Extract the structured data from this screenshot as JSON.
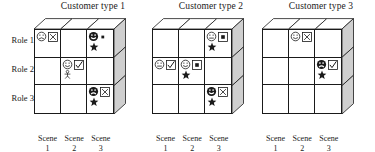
{
  "figure": {
    "role_labels": [
      "Role 1",
      "Role 2",
      "Role 3"
    ],
    "scene_labels": [
      {
        "name": "Scene",
        "number": "1"
      },
      {
        "name": "Scene",
        "number": "2"
      },
      {
        "name": "Scene",
        "number": "3"
      }
    ],
    "colors": {
      "line": "#1a1a1a",
      "face_shade": "#cfcfcf",
      "background": "#ffffff"
    },
    "icon_legend": {
      "face-sad-outline": "sad face, outline",
      "face-neutral-outline": "neutral face, outline",
      "face-smile-outline": "smiling face, outline",
      "face-smile-filled": "smiling face, filled dark",
      "face-sad-filled": "sad face, filled dark",
      "box-x": "square box containing an X",
      "box-check": "square box containing a check mark",
      "box-dot": "square box containing a filled dot",
      "dot-small": "small filled dot",
      "star-filled": "filled star",
      "star-outline": "outline star",
      "person": "small person figure"
    },
    "panels": [
      {
        "title": "Customer type 1",
        "cells": [
          {
            "row": 0,
            "col": 0,
            "icons": [
              "face-sad-outline",
              "box-x"
            ],
            "icons2": []
          },
          {
            "row": 0,
            "col": 1,
            "icons": [],
            "icons2": []
          },
          {
            "row": 0,
            "col": 2,
            "icons": [
              "face-smile-filled",
              "dot-small"
            ],
            "icons2": [
              "star-filled"
            ]
          },
          {
            "row": 1,
            "col": 0,
            "icons": [],
            "icons2": []
          },
          {
            "row": 1,
            "col": 1,
            "icons": [
              "face-smile-outline",
              "box-check"
            ],
            "icons2": [
              "person"
            ]
          },
          {
            "row": 1,
            "col": 2,
            "icons": [],
            "icons2": []
          },
          {
            "row": 2,
            "col": 0,
            "icons": [],
            "icons2": []
          },
          {
            "row": 2,
            "col": 1,
            "icons": [],
            "icons2": []
          },
          {
            "row": 2,
            "col": 2,
            "icons": [
              "face-sad-filled",
              "box-x"
            ],
            "icons2": [
              "star-filled"
            ]
          }
        ]
      },
      {
        "title": "Customer type 2",
        "cells": [
          {
            "row": 0,
            "col": 0,
            "icons": [],
            "icons2": []
          },
          {
            "row": 0,
            "col": 1,
            "icons": [],
            "icons2": []
          },
          {
            "row": 0,
            "col": 2,
            "icons": [
              "face-neutral-outline",
              "box-dot"
            ],
            "icons2": [
              "star-filled"
            ]
          },
          {
            "row": 1,
            "col": 0,
            "icons": [
              "face-neutral-outline",
              "box-check"
            ],
            "icons2": []
          },
          {
            "row": 1,
            "col": 1,
            "icons": [
              "face-smile-outline",
              "box-dot"
            ],
            "icons2": [
              "star-filled"
            ]
          },
          {
            "row": 1,
            "col": 2,
            "icons": [],
            "icons2": []
          },
          {
            "row": 2,
            "col": 0,
            "icons": [],
            "icons2": []
          },
          {
            "row": 2,
            "col": 1,
            "icons": [],
            "icons2": []
          },
          {
            "row": 2,
            "col": 2,
            "icons": [
              "face-smile-filled",
              "box-x"
            ],
            "icons2": [
              "star-filled"
            ]
          }
        ]
      },
      {
        "title": "Customer type 3",
        "cells": [
          {
            "row": 0,
            "col": 0,
            "icons": [],
            "icons2": []
          },
          {
            "row": 0,
            "col": 1,
            "icons": [
              "face-smile-outline",
              "box-x"
            ],
            "icons2": []
          },
          {
            "row": 0,
            "col": 2,
            "icons": [],
            "icons2": []
          },
          {
            "row": 1,
            "col": 0,
            "icons": [],
            "icons2": []
          },
          {
            "row": 1,
            "col": 1,
            "icons": [],
            "icons2": []
          },
          {
            "row": 1,
            "col": 2,
            "icons": [
              "face-sad-filled",
              "box-check"
            ],
            "icons2": [
              "star-filled"
            ]
          },
          {
            "row": 2,
            "col": 0,
            "icons": [],
            "icons2": []
          },
          {
            "row": 2,
            "col": 1,
            "icons": [],
            "icons2": []
          },
          {
            "row": 2,
            "col": 2,
            "icons": [],
            "icons2": []
          }
        ]
      }
    ]
  }
}
